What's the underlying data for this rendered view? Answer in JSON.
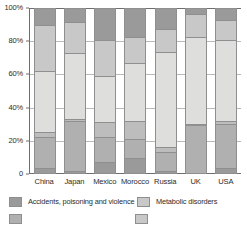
{
  "chart_data": {
    "type": "bar",
    "subtype": "100% stacked column",
    "title": "",
    "xlabel": "",
    "ylabel": "",
    "ylim": [
      0,
      100
    ],
    "yunit": "%",
    "ytick_labels": [
      "0",
      "20%",
      "40%",
      "60%",
      "80%",
      "100%"
    ],
    "ytick_values": [
      0,
      20,
      40,
      60,
      80,
      100
    ],
    "grid": true,
    "legend_position": "bottom",
    "categories": [
      "China",
      "Japan",
      "Mexico",
      "Morocco",
      "Russia",
      "UK",
      "USA"
    ],
    "series": [
      {
        "name": "Accidents, poisoning and violence",
        "color": "#9a9a9a",
        "values": [
          10,
          8,
          19,
          17,
          12,
          3,
          7
        ]
      },
      {
        "name": "Metabolic disorders",
        "color": "#c8c8c8",
        "values": [
          28,
          19,
          22,
          16,
          14,
          14,
          12
        ]
      },
      {
        "name": "Series 3",
        "color": "#dededd",
        "values": [
          37,
          41,
          28,
          35,
          58,
          53,
          49
        ]
      },
      {
        "name": "Series 4",
        "color": "#bdbdbd",
        "values": [
          3,
          1,
          9,
          11,
          3,
          1,
          2
        ]
      },
      {
        "name": "Series 5",
        "color": "#b0b0b0",
        "values": [
          19,
          31,
          15,
          12,
          12,
          29,
          27
        ]
      },
      {
        "name": "Series 6",
        "color": "#9a9a9a",
        "values": [
          3,
          0,
          7,
          9,
          1,
          0,
          3
        ]
      }
    ],
    "stacks": [
      {
        "category": "China",
        "segments": [
          {
            "series": "Accidents, poisoning and violence",
            "from": 90,
            "to": 100,
            "color": "#9a9a9a"
          },
          {
            "series": "Metabolic disorders",
            "from": 62,
            "to": 90,
            "color": "#c8c8c8"
          },
          {
            "series": "Series 3",
            "from": 25,
            "to": 62,
            "color": "#dededd"
          },
          {
            "series": "Series 4",
            "from": 22,
            "to": 25,
            "color": "#bdbdbd"
          },
          {
            "series": "Series 5",
            "from": 3,
            "to": 22,
            "color": "#b0b0b0"
          },
          {
            "series": "Series 6",
            "from": 0,
            "to": 3,
            "color": "#9a9a9a"
          }
        ]
      },
      {
        "category": "Japan",
        "segments": [
          {
            "series": "Accidents, poisoning and violence",
            "from": 92,
            "to": 100,
            "color": "#9a9a9a"
          },
          {
            "series": "Metabolic disorders",
            "from": 73,
            "to": 92,
            "color": "#c8c8c8"
          },
          {
            "series": "Series 3",
            "from": 33,
            "to": 73,
            "color": "#dededd"
          },
          {
            "series": "Series 4",
            "from": 32,
            "to": 33,
            "color": "#bdbdbd"
          },
          {
            "series": "Series 5",
            "from": 1,
            "to": 32,
            "color": "#b0b0b0"
          },
          {
            "series": "Series 6",
            "from": 0,
            "to": 1,
            "color": "#9a9a9a"
          }
        ]
      },
      {
        "category": "Mexico",
        "segments": [
          {
            "series": "Accidents, poisoning and violence",
            "from": 81,
            "to": 100,
            "color": "#9a9a9a"
          },
          {
            "series": "Metabolic disorders",
            "from": 59,
            "to": 81,
            "color": "#c8c8c8"
          },
          {
            "series": "Series 3",
            "from": 31,
            "to": 59,
            "color": "#dededd"
          },
          {
            "series": "Series 4",
            "from": 22,
            "to": 31,
            "color": "#bdbdbd"
          },
          {
            "series": "Series 5",
            "from": 7,
            "to": 22,
            "color": "#b0b0b0"
          },
          {
            "series": "Series 6",
            "from": 0,
            "to": 7,
            "color": "#9a9a9a"
          }
        ]
      },
      {
        "category": "Morocco",
        "segments": [
          {
            "series": "Accidents, poisoning and violence",
            "from": 83,
            "to": 100,
            "color": "#9a9a9a"
          },
          {
            "series": "Metabolic disorders",
            "from": 67,
            "to": 83,
            "color": "#c8c8c8"
          },
          {
            "series": "Series 3",
            "from": 32,
            "to": 67,
            "color": "#dededd"
          },
          {
            "series": "Series 4",
            "from": 21,
            "to": 32,
            "color": "#bdbdbd"
          },
          {
            "series": "Series 5",
            "from": 9,
            "to": 21,
            "color": "#b0b0b0"
          },
          {
            "series": "Series 6",
            "from": 0,
            "to": 9,
            "color": "#9a9a9a"
          }
        ]
      },
      {
        "category": "Russia",
        "segments": [
          {
            "series": "Accidents, poisoning and violence",
            "from": 88,
            "to": 100,
            "color": "#9a9a9a"
          },
          {
            "series": "Metabolic disorders",
            "from": 74,
            "to": 88,
            "color": "#c8c8c8"
          },
          {
            "series": "Series 3",
            "from": 16,
            "to": 74,
            "color": "#dededd"
          },
          {
            "series": "Series 4",
            "from": 13,
            "to": 16,
            "color": "#bdbdbd"
          },
          {
            "series": "Series 5",
            "from": 1,
            "to": 13,
            "color": "#b0b0b0"
          },
          {
            "series": "Series 6",
            "from": 0,
            "to": 1,
            "color": "#9a9a9a"
          }
        ]
      },
      {
        "category": "UK",
        "segments": [
          {
            "series": "Accidents, poisoning and violence",
            "from": 97,
            "to": 100,
            "color": "#9a9a9a"
          },
          {
            "series": "Metabolic disorders",
            "from": 83,
            "to": 97,
            "color": "#c8c8c8"
          },
          {
            "series": "Series 3",
            "from": 30,
            "to": 83,
            "color": "#dededd"
          },
          {
            "series": "Series 4",
            "from": 29,
            "to": 30,
            "color": "#bdbdbd"
          },
          {
            "series": "Series 5",
            "from": 0,
            "to": 29,
            "color": "#b0b0b0"
          }
        ]
      },
      {
        "category": "USA",
        "segments": [
          {
            "series": "Accidents, poisoning and violence",
            "from": 93,
            "to": 100,
            "color": "#9a9a9a"
          },
          {
            "series": "Metabolic disorders",
            "from": 81,
            "to": 93,
            "color": "#c8c8c8"
          },
          {
            "series": "Series 3",
            "from": 32,
            "to": 81,
            "color": "#dededd"
          },
          {
            "series": "Series 4",
            "from": 30,
            "to": 32,
            "color": "#bdbdbd"
          },
          {
            "series": "Series 5",
            "from": 3,
            "to": 30,
            "color": "#b0b0b0"
          },
          {
            "series": "Series 6",
            "from": 0,
            "to": 3,
            "color": "#9a9a9a"
          }
        ]
      }
    ]
  },
  "legend": {
    "items": [
      {
        "label": "Accidents, poisoning and violence",
        "color": "#9a9a9a"
      },
      {
        "label": "Metabolic disorders",
        "color": "#c8c8c8"
      },
      {
        "label": "",
        "color": "#b0b0b0"
      },
      {
        "label": "",
        "color": "#c8c8c8"
      }
    ]
  },
  "colors": {
    "accent_dark": "#9a9a9a",
    "accent_mid": "#b0b0b0",
    "accent_light": "#c8c8c8",
    "accent_lightest": "#dededd",
    "axis": "#6e6e6e",
    "grid": "#b9b9b9",
    "text": "#2b2b2b",
    "background": "#ffffff"
  }
}
